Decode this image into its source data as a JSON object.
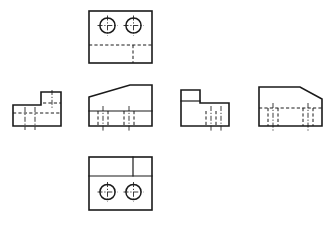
{
  "sheet": {
    "title": "Orthographic Projection Views",
    "background_color": "#ffffff",
    "line_color": "#1a1a1a",
    "width": 332,
    "height": 227
  },
  "views": [
    {
      "id": "top-view",
      "name": "top-view",
      "label": "Top View",
      "position": {
        "x": 89,
        "y": 11,
        "width": 63,
        "height": 52
      },
      "outline": "rectangle",
      "features": [
        "two-holes",
        "hidden-step-line"
      ],
      "holes": [
        {
          "cx": 107.5,
          "cy": 25.5,
          "r": 7.5
        },
        {
          "cx": 133.5,
          "cy": 25.5,
          "r": 7.5
        }
      ],
      "hidden_lines": [
        {
          "type": "horizontal",
          "x1": 89,
          "y1": 45,
          "x2": 152,
          "y2": 45
        },
        {
          "type": "vertical",
          "x1": 133,
          "y1": 45,
          "x2": 133,
          "y2": 63
        }
      ]
    },
    {
      "id": "left-side-view",
      "name": "left-side-view",
      "label": "Left Side View",
      "position": {
        "x": 13,
        "y": 93,
        "width": 48,
        "height": 33
      },
      "outline": "l-shape-right-tall",
      "features": [
        "hidden-hole-lines"
      ],
      "hidden_lines": [
        {
          "type": "horizontal",
          "x1": 13,
          "y1": 113,
          "x2": 61,
          "y2": 113
        },
        {
          "type": "vertical",
          "x1": 26,
          "y1": 113,
          "x2": 26,
          "y2": 126
        },
        {
          "type": "vertical",
          "x1": 34,
          "y1": 113,
          "x2": 34,
          "y2": 126
        },
        {
          "type": "vertical",
          "x1": 44,
          "y1": 113,
          "x2": 44,
          "y2": 126
        },
        {
          "type": "horizontal",
          "x1": 48,
          "y1": 103,
          "x2": 61,
          "y2": 103
        }
      ]
    },
    {
      "id": "front-view",
      "name": "front-view",
      "label": "Front View",
      "position": {
        "x": 89,
        "y": 85,
        "width": 63,
        "height": 41
      },
      "outline": "wedge-left-slope",
      "features": [
        "angled-top-face",
        "hidden-hole-lines"
      ],
      "hidden_lines": [
        {
          "type": "vertical",
          "x1": 98,
          "y1": 111,
          "x2": 98,
          "y2": 126
        },
        {
          "type": "vertical",
          "x1": 108,
          "y1": 111,
          "x2": 108,
          "y2": 126
        },
        {
          "type": "vertical",
          "x1": 124,
          "y1": 111,
          "x2": 124,
          "y2": 126
        },
        {
          "type": "vertical",
          "x1": 134,
          "y1": 111,
          "x2": 134,
          "y2": 126
        }
      ]
    },
    {
      "id": "right-side-view",
      "name": "right-side-view",
      "label": "Right Side View",
      "position": {
        "x": 181,
        "y": 90,
        "width": 48,
        "height": 36
      },
      "outline": "l-shape-left-tall",
      "features": [
        "hidden-hole-lines"
      ],
      "hidden_lines": [
        {
          "type": "vertical",
          "x1": 206,
          "y1": 111,
          "x2": 206,
          "y2": 126
        },
        {
          "type": "vertical",
          "x1": 216,
          "y1": 111,
          "x2": 216,
          "y2": 126
        }
      ]
    },
    {
      "id": "rear-view",
      "name": "rear-view",
      "label": "Rear View",
      "position": {
        "x": 259,
        "y": 87,
        "width": 63,
        "height": 39
      },
      "outline": "wedge-right-slope",
      "features": [
        "angled-top-face",
        "hidden-step-line",
        "hidden-hole-lines"
      ],
      "hidden_lines": [
        {
          "type": "horizontal",
          "x1": 259,
          "y1": 108,
          "x2": 322,
          "y2": 108
        },
        {
          "type": "vertical",
          "x1": 268,
          "y1": 108,
          "x2": 268,
          "y2": 126
        },
        {
          "type": "vertical",
          "x1": 278,
          "y1": 108,
          "x2": 278,
          "y2": 126
        },
        {
          "type": "vertical",
          "x1": 303,
          "y1": 108,
          "x2": 303,
          "y2": 126
        },
        {
          "type": "vertical",
          "x1": 313,
          "y1": 108,
          "x2": 313,
          "y2": 126
        }
      ]
    },
    {
      "id": "bottom-view",
      "name": "bottom-view",
      "label": "Bottom View",
      "position": {
        "x": 89,
        "y": 157,
        "width": 63,
        "height": 53
      },
      "outline": "rectangle",
      "features": [
        "two-holes",
        "step-line",
        "partition-line"
      ],
      "holes": [
        {
          "cx": 107.5,
          "cy": 192,
          "r": 7.5
        },
        {
          "cx": 133.5,
          "cy": 192,
          "r": 7.5
        }
      ],
      "visible_lines": [
        {
          "type": "horizontal",
          "x1": 89,
          "y1": 176,
          "x2": 152,
          "y2": 176
        },
        {
          "type": "vertical",
          "x1": 133,
          "y1": 157,
          "x2": 133,
          "y2": 176
        }
      ]
    }
  ]
}
